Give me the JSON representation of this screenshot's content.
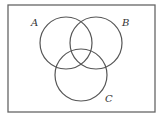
{
  "diagram": {
    "type": "venn",
    "universe": {
      "x": 8,
      "y": 5,
      "width": 147,
      "height": 107,
      "stroke": "#666666"
    },
    "circle_stroke": "#555555",
    "sets": [
      {
        "label": "A",
        "cx": 66,
        "cy": 43,
        "r": 26,
        "label_x": 31,
        "label_y": 26
      },
      {
        "label": "B",
        "cx": 96,
        "cy": 43,
        "r": 26,
        "label_x": 122,
        "label_y": 26
      },
      {
        "label": "C",
        "cx": 81,
        "cy": 75,
        "r": 26,
        "label_x": 105,
        "label_y": 102
      }
    ]
  }
}
